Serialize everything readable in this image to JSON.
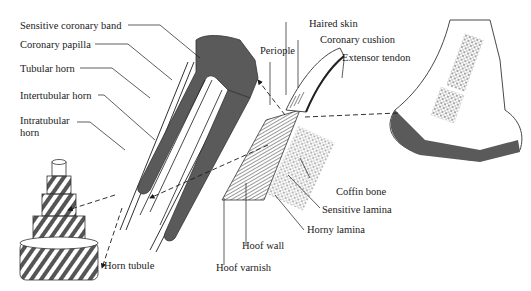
{
  "diagram": {
    "labels": {
      "sensitive_coronary_band": "Sensitive coronary band",
      "coronary_papilla": "Coronary papilla",
      "tubular_horn": "Tubular horn",
      "intertubular_horn": "Intertubular horn",
      "intratubular_horn_1": "Intratubular",
      "intratubular_horn_2": "horn",
      "horn_tubule": "Horn tubule",
      "periople": "Periople",
      "haired_skin": "Haired skin",
      "coronary_cushion": "Coronary cushion",
      "extensor_tendon": "Extensor tendon",
      "coffin_bone": "Coffin bone",
      "sensitive_lamina": "Sensitive lamina",
      "horny_lamina": "Horny lamina",
      "hoof_wall": "Hoof wall",
      "hoof_varnish": "Hoof varnish"
    },
    "colors": {
      "ink": "#1a1a1a",
      "fill_dark": "#5a5a5a",
      "background": "#ffffff"
    }
  }
}
